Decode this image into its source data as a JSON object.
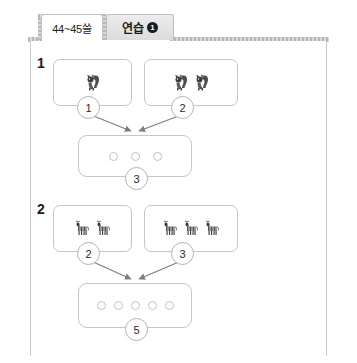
{
  "tabs": [
    {
      "id": "page-range",
      "label": "44~45쓸",
      "active": true
    },
    {
      "id": "practice",
      "label": "연습",
      "badge": "1",
      "active": false
    }
  ],
  "exercises": [
    {
      "number": "1",
      "animal": "squirrel",
      "left_box": {
        "count": 2,
        "bubble": "1"
      },
      "right_box": {
        "count": 2,
        "bubble": "2"
      },
      "result": {
        "dots": 3,
        "bubble": "3"
      }
    },
    {
      "number": "2",
      "animal": "zebra",
      "left_box": {
        "count": 2,
        "bubble": "2"
      },
      "right_box": {
        "count": 3,
        "bubble": "3"
      },
      "result": {
        "dots": 5,
        "bubble": "5"
      }
    }
  ],
  "colors": {
    "frame_border": "#c9c9c9",
    "band_dark": "#b9b9b9",
    "band_light": "#d8d8d8",
    "box_border": "#c6c6c6",
    "bubble_border": "#b4b4b4",
    "arrow": "#7d7d7d",
    "text": "#1d1d1d",
    "tab_active_bg": "#ffffff",
    "tab_inactive_bg": "#e4e4e4"
  },
  "icons": {
    "squirrel": "squirrel-icon",
    "zebra": "zebra-icon",
    "arrow": "arrow-down-right-icon"
  }
}
